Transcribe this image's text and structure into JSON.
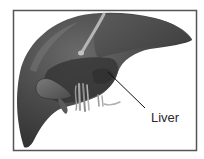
{
  "figure": {
    "type": "anatomical-illustration",
    "subject": "liver",
    "style": "grayscale"
  },
  "labels": [
    {
      "text": "Liver",
      "target": "liver"
    }
  ],
  "colors": {
    "frame": "#555555",
    "liver_main": "#4a4a4a",
    "liver_dark": "#3a3a3a",
    "liver_highlight": "#6e6e6e",
    "ligament": "#b0b0b0",
    "vessels": "#9a9a9a",
    "pointer": "#111111",
    "background": "#ffffff"
  }
}
